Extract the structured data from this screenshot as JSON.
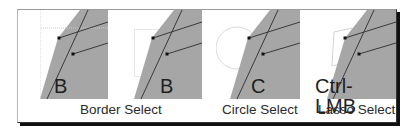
{
  "figure": {
    "panels": [
      {
        "key": "B",
        "caption": "",
        "selection_shape": "crosshair"
      },
      {
        "key": "B",
        "caption": "Border Select",
        "selection_shape": "rectangle"
      },
      {
        "key": "C",
        "caption": "Circle Select",
        "selection_shape": "circle"
      },
      {
        "key": "Ctrl- LMB",
        "caption": "Lasso Select",
        "selection_shape": "lasso"
      }
    ],
    "colors": {
      "mesh_face": "#a6a6a6",
      "edge_line": "#3a3a3a",
      "vertex": "#111111",
      "selection_outline": "#d0d0d0",
      "frame_shadow": "#111111"
    }
  }
}
